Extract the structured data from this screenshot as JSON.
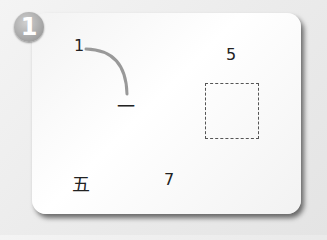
{
  "badge": {
    "number": "1"
  },
  "items": {
    "start_number": "1",
    "start_char": "一",
    "target_number": "5",
    "answer_box": "",
    "char_five": "五",
    "number_seven": "7"
  },
  "colors": {
    "arc": "#999999",
    "box_border": "#555555",
    "badge": "#a8a8a8"
  }
}
